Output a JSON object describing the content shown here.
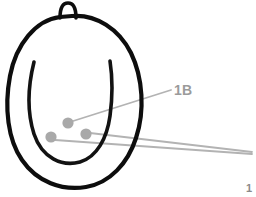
{
  "figure": {
    "background_color": "#ffffff",
    "width": 256,
    "height": 197
  },
  "colors": {
    "outline_stroke": "#0d0d0d",
    "inner_stroke": "#121212",
    "annotation_gray": "#b3b3b3",
    "marker_gray": "#a9a9a9",
    "label_gray": "#9b9b9b",
    "corner_mark_gray": "#8a8a8a"
  },
  "shapes": {
    "outer_outline": {
      "name": "egg-outline",
      "stroke_width": 4.2,
      "path": "M 60 17 C 36 20 16 44 10 76 C 4 108 8 140 22 160 C 37 182 62 191 86 187 C 110 183 128 163 136 138 C 145 111 143 78 131 53 C 119 29 96 14 72 16 Z"
    },
    "stem_loop": {
      "name": "stem-loop",
      "stroke_width": 3.6,
      "path": "M 60 18 C 60 7 63 3 68 3 C 73 3 76 8 76 18"
    },
    "inner_curve": {
      "name": "inner-u-curve",
      "stroke_width": 3.6,
      "path": "M 34 62 C 28 86 27 112 34 134 C 42 158 62 167 80 162 C 97 157 107 138 110 116 C 113 94 112 74 110 61"
    }
  },
  "markers": [
    {
      "id": "marker-a",
      "label": "1B",
      "cx": 68,
      "cy": 123,
      "r": 5.6
    },
    {
      "id": "marker-b",
      "label": "",
      "cx": 51,
      "cy": 137,
      "r": 5.6
    },
    {
      "id": "marker-c",
      "label": "",
      "cx": 86,
      "cy": 134,
      "r": 5.6
    }
  ],
  "leader_lines": [
    {
      "id": "leader-1b",
      "from_x": 70,
      "from_y": 122,
      "to_x": 171,
      "to_y": 90,
      "stroke_width": 1.8
    },
    {
      "id": "leader-upper-right",
      "from_x": 90,
      "from_y": 133,
      "to_x": 252,
      "to_y": 152,
      "stroke_width": 1.8
    },
    {
      "id": "leader-lower-right",
      "from_x": 55,
      "from_y": 140,
      "to_x": 252,
      "to_y": 154,
      "stroke_width": 1.8
    }
  ],
  "labels": {
    "primary": {
      "text": "1B",
      "x": 174,
      "y": 95
    },
    "corner_mark": {
      "text": "1",
      "x": 246,
      "y": 192
    }
  }
}
